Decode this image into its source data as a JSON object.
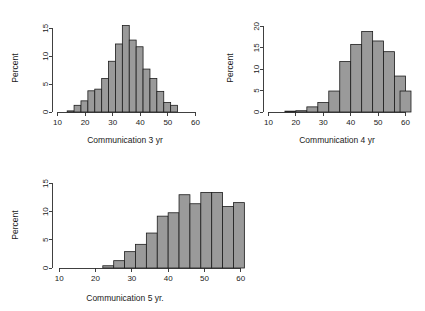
{
  "figure": {
    "background": "#ffffff",
    "bar_fill": "#9a9a9a",
    "bar_stroke": "#1c1c1c",
    "axis_color": "#2b2b2b"
  },
  "chart_data": [
    {
      "type": "bar",
      "title": "",
      "xlabel": "Communication 3 yr",
      "ylabel": "Percent",
      "xlim": [
        8,
        62
      ],
      "ylim": [
        0,
        16.5
      ],
      "xticks": [
        10,
        20,
        30,
        40,
        50,
        60
      ],
      "yticks": [
        0,
        5,
        10,
        15
      ],
      "grid": false,
      "legend": "none",
      "bin_width": 2.5,
      "bin_starts": [
        13.5,
        16,
        18.5,
        21,
        23.5,
        26,
        28.5,
        31,
        33.5,
        36,
        38.5,
        41,
        43.5,
        46,
        48.5,
        51,
        53.5,
        56,
        58.5
      ],
      "categories": [
        "13.5",
        "16",
        "18.5",
        "21",
        "23.5",
        "26",
        "28.5",
        "31",
        "33.5",
        "36",
        "38.5",
        "41",
        "43.5",
        "46",
        "48.5",
        "51",
        "53.5",
        "56",
        "58.5"
      ],
      "values": [
        0.2,
        1.2,
        2.0,
        3.8,
        4.1,
        6.0,
        9.1,
        12.2,
        15.5,
        12.9,
        11.7,
        7.7,
        6.0,
        3.7,
        1.7,
        1.2,
        0,
        0,
        0
      ]
    },
    {
      "type": "bar",
      "title": "",
      "xlabel": "Communication 4 yr",
      "ylabel": "Percent",
      "xlim": [
        8,
        62
      ],
      "ylim": [
        0,
        21.5
      ],
      "xticks": [
        10,
        20,
        30,
        40,
        50,
        60
      ],
      "yticks": [
        0,
        5,
        10,
        15,
        20
      ],
      "grid": false,
      "legend": "none",
      "bin_width": 4,
      "bin_starts": [
        16,
        20,
        24,
        28,
        32,
        36,
        40,
        44,
        48,
        52,
        56
      ],
      "categories": [
        "16",
        "20",
        "24",
        "28",
        "32",
        "36",
        "40",
        "44",
        "48",
        "52",
        "56"
      ],
      "values": [
        0.2,
        0.3,
        1.2,
        2.2,
        4.9,
        11.8,
        15.8,
        18.8,
        16.6,
        14.1,
        8.4
      ],
      "extra_bin_start": 58,
      "extra_value": 4.9
    },
    {
      "type": "bar",
      "title": "",
      "xlabel": "Communication 5 yr.",
      "ylabel": "Percent",
      "xlim": [
        8,
        62
      ],
      "ylim": [
        0,
        16.5
      ],
      "xticks": [
        10,
        20,
        30,
        40,
        50,
        60
      ],
      "yticks": [
        0,
        5,
        10,
        15
      ],
      "grid": false,
      "legend": "none",
      "bin_width": 3,
      "bin_starts": [
        22,
        25,
        28,
        31,
        34,
        37,
        40,
        43,
        46,
        49,
        52,
        55,
        58
      ],
      "categories": [
        "22",
        "25",
        "28",
        "31",
        "34",
        "37",
        "40",
        "43",
        "46",
        "49",
        "52",
        "55",
        "58"
      ],
      "values": [
        0.4,
        1.3,
        2.9,
        4.2,
        6.2,
        9.2,
        9.8,
        13.0,
        11.4,
        13.4,
        13.4,
        10.9,
        11.6
      ]
    }
  ]
}
